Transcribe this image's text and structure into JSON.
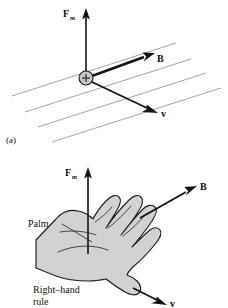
{
  "figure": {
    "caption_a": "(a)",
    "panels": [
      {
        "id": "panel-a",
        "type": "charge-in-field",
        "labels": {
          "force": "F",
          "force_sub": "m",
          "field": "B",
          "velocity": "v",
          "charge_sign": "+"
        },
        "field_line_count": 4,
        "field_line_color": "#8d8d8d",
        "charge_fill": "#c9c9c9",
        "vectors": [
          {
            "name": "force",
            "label": "F",
            "subscript": "m",
            "direction": "up"
          },
          {
            "name": "magnetic-field",
            "label": "B",
            "subscript": "",
            "direction": "up-right"
          },
          {
            "name": "velocity",
            "label": "v",
            "subscript": "",
            "direction": "down-right"
          }
        ]
      },
      {
        "id": "panel-b",
        "type": "right-hand-rule",
        "labels": {
          "force": "F",
          "force_sub": "m",
          "field": "B",
          "velocity": "v",
          "palm": "Palm",
          "rule_line1": "Right–hand",
          "rule_line2": "rule"
        },
        "hand_fill": "#d2d2d2",
        "vectors": [
          {
            "name": "force",
            "label": "F",
            "subscript": "m",
            "direction": "up"
          },
          {
            "name": "magnetic-field",
            "label": "B",
            "subscript": "",
            "direction": "up-right"
          },
          {
            "name": "velocity",
            "label": "v",
            "subscript": "",
            "direction": "down-right"
          }
        ]
      }
    ]
  },
  "colors": {
    "ink": "#141414",
    "field_line": "#8d8d8d",
    "charge_fill": "#c9c9c9",
    "hand_fill": "#d2d2d2",
    "background": "#ffffff"
  }
}
